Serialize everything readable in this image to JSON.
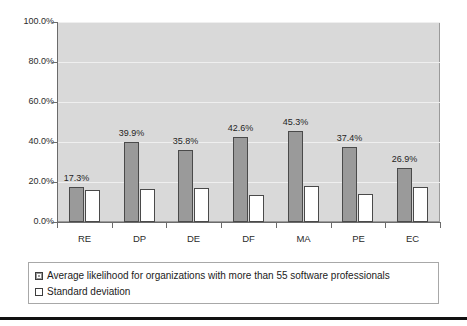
{
  "chart_data": {
    "type": "bar",
    "title": "",
    "subtitle": "",
    "xlabel": "",
    "ylabel": "",
    "categories": [
      "RE",
      "DP",
      "DE",
      "DF",
      "MA",
      "PE",
      "EC"
    ],
    "ylim": [
      0,
      100
    ],
    "ytick_labels": [
      "100.0%",
      "80.0%",
      "60.0%",
      "40.0%",
      "20.0%",
      "0.0%"
    ],
    "ytick_values": [
      100,
      80,
      60,
      40,
      20,
      0
    ],
    "grid": true,
    "legend_position": "bottom",
    "series": [
      {
        "name": "Average likelihood for organizations with more than 55 software professionals",
        "color": "#9a9a9a",
        "values": [
          17.3,
          39.9,
          35.8,
          42.6,
          45.3,
          37.4,
          26.9
        ],
        "data_labels": [
          "17.3%",
          "39.9%",
          "35.8%",
          "42.6%",
          "45.3%",
          "37.4%",
          "26.9%"
        ]
      },
      {
        "name": "Standard deviation",
        "color": "#ffffff",
        "values": [
          16.0,
          16.5,
          17.0,
          13.7,
          17.8,
          14.2,
          17.5
        ],
        "data_labels": [
          "",
          "",
          "",
          "",
          "",
          "",
          ""
        ]
      }
    ]
  },
  "legend": {
    "entries": [
      {
        "label": "Average likelihood for organizations with more than 55 software professionals",
        "swatch": "gray-filled-square"
      },
      {
        "label": "Standard deviation",
        "swatch": "white-square"
      }
    ]
  },
  "colors": {
    "plot_background": "#d9d9d9",
    "series_main": "#9a9a9a",
    "series_dev": "#ffffff",
    "bar_border": "#4a4a4a",
    "axis": "#6b6b6b",
    "gridline": "#efefef",
    "text": "#1f1f1f"
  }
}
